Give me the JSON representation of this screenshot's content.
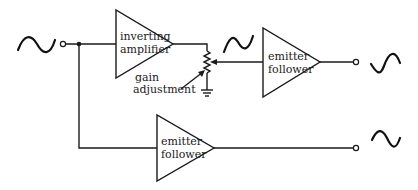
{
  "diagram": {
    "type": "block-schematic",
    "blocks": [
      {
        "id": "inv_amp",
        "label_line1": "inverting",
        "label_line2": "amplifier"
      },
      {
        "id": "ef1",
        "label_line1": "emitter",
        "label_line2": "follower"
      },
      {
        "id": "ef2",
        "label_line1": "emitter",
        "label_line2": "follower"
      }
    ],
    "annotations": {
      "gain_line1": "gain",
      "gain_line2": "adjustment"
    },
    "signals": {
      "input": "sine",
      "mid": "inverted-sine",
      "output_top": "inverted-sine",
      "output_bottom": "sine"
    },
    "colors": {
      "line": "#1a1a1a",
      "background": "#ffffff"
    }
  }
}
